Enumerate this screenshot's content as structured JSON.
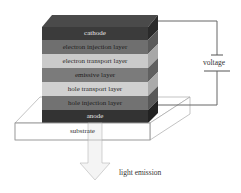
{
  "diagram": {
    "layers": [
      {
        "label": "cathode",
        "color": "#3b3b3b",
        "text_color": "#e6e6e6"
      },
      {
        "label": "electron injection layer",
        "color": "#6f6f6f",
        "text_color": "#1e1e1e"
      },
      {
        "label": "electron transport layer",
        "color": "#cacaca",
        "text_color": "#2a2a2a"
      },
      {
        "label": "emissive layer",
        "color": "#7b7b7b",
        "text_color": "#1e1e1e"
      },
      {
        "label": "hole transport layer",
        "color": "#d0d0d0",
        "text_color": "#2a2a2a"
      },
      {
        "label": "hole injection layer",
        "color": "#727272",
        "text_color": "#1e1e1e"
      },
      {
        "label": "anode",
        "color": "#333333",
        "text_color": "#e6e6e6"
      }
    ],
    "substrate_label": "substrate",
    "voltage_label": "voltage",
    "light_label": "light emission"
  }
}
